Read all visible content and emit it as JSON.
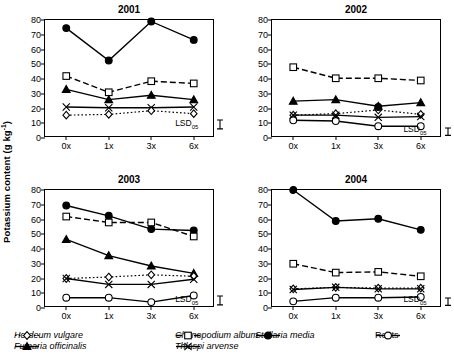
{
  "axis": {
    "ylabel_text": "Potassium content (g kg",
    "ylabel_sup": "-1",
    "ylabel_tail": ")",
    "yticks": [
      0,
      10,
      20,
      30,
      40,
      50,
      60,
      70,
      80
    ],
    "xticks": [
      "0x",
      "1x",
      "3x",
      "6x"
    ],
    "lsd_label": "LSD",
    "lsd_sub": "05"
  },
  "legend": [
    {
      "name": "Hordeum vulgare",
      "marker": "diamond-open",
      "line": "dotted",
      "italic": true,
      "row": 0,
      "col": 0
    },
    {
      "name": "Fumaria officinalis",
      "marker": "triangle-fill",
      "line": "solid",
      "italic": true,
      "row": 1,
      "col": 0
    },
    {
      "name": "Chenopodium album",
      "marker": "square-open",
      "line": "dashed",
      "italic": true,
      "row": 0,
      "col": 1
    },
    {
      "name": "Thlaspi arvense",
      "marker": "cross",
      "line": "solid",
      "italic": true,
      "row": 1,
      "col": 1
    },
    {
      "name": "Stellaria media",
      "marker": "circle-fill",
      "line": "solid",
      "italic": true,
      "row": 0,
      "col": 2
    },
    {
      "name": "Roots",
      "marker": "circle-open",
      "line": "solid",
      "italic": false,
      "row": 0,
      "col": 3
    }
  ],
  "chart_data": [
    {
      "type": "line",
      "title": "2001",
      "xlabel": "",
      "ylabel": "Potassium content (g kg-1)",
      "categories": [
        "0x",
        "1x",
        "3x",
        "6x"
      ],
      "ylim": [
        0,
        80
      ],
      "yticks": [
        0,
        10,
        20,
        30,
        40,
        50,
        60,
        70,
        80
      ],
      "grid": false,
      "lsd": {
        "label": "LSD05",
        "value": 6.0,
        "x": 3.55,
        "y": 9
      },
      "series": [
        {
          "name": "Stellaria media",
          "marker": "circle-fill",
          "line": "solid",
          "values": [
            74.5,
            52.5,
            79.0,
            66.5
          ]
        },
        {
          "name": "Chenopodium album",
          "marker": "square-open",
          "line": "dashed",
          "values": [
            42.0,
            31.0,
            38.5,
            37.0
          ]
        },
        {
          "name": "Fumaria officinalis",
          "marker": "triangle-fill",
          "line": "solid",
          "values": [
            33.0,
            26.0,
            29.0,
            26.0
          ]
        },
        {
          "name": "Thlaspi arvense",
          "marker": "cross",
          "line": "solid",
          "values": [
            21.0,
            20.5,
            20.5,
            21.0
          ]
        },
        {
          "name": "Hordeum vulgare",
          "marker": "diamond-open",
          "line": "dotted",
          "values": [
            15.5,
            16.0,
            18.5,
            16.5
          ]
        }
      ]
    },
    {
      "type": "line",
      "title": "2002",
      "xlabel": "",
      "ylabel": "Potassium content (g kg-1)",
      "categories": [
        "0x",
        "1x",
        "3x",
        "6x"
      ],
      "ylim": [
        0,
        80
      ],
      "yticks": [
        0,
        10,
        20,
        30,
        40,
        50,
        60,
        70,
        80
      ],
      "grid": false,
      "lsd": {
        "label": "LSD05",
        "value": 5.0,
        "x": 3.58,
        "y": 4.5
      },
      "series": [
        {
          "name": "Chenopodium album",
          "marker": "square-open",
          "line": "dashed",
          "values": [
            48.0,
            40.5,
            40.5,
            39.0
          ]
        },
        {
          "name": "Fumaria officinalis",
          "marker": "triangle-fill",
          "line": "solid",
          "values": [
            25.0,
            26.0,
            21.5,
            24.0
          ]
        },
        {
          "name": "Hordeum vulgare",
          "marker": "diamond-open",
          "line": "dotted",
          "values": [
            15.5,
            16.5,
            19.0,
            16.0
          ]
        },
        {
          "name": "Thlaspi arvense",
          "marker": "cross",
          "line": "solid",
          "values": [
            15.5,
            15.5,
            14.0,
            14.5
          ]
        },
        {
          "name": "Stellaria media",
          "marker": "circle-fill",
          "line": "solid",
          "values": [
            null,
            null,
            21.0,
            null
          ]
        },
        {
          "name": "Roots",
          "marker": "circle-open",
          "line": "solid",
          "values": [
            12.0,
            11.5,
            8.0,
            8.0
          ]
        }
      ]
    },
    {
      "type": "line",
      "title": "2003",
      "xlabel": "",
      "ylabel": "Potassium content (g kg-1)",
      "categories": [
        "0x",
        "1x",
        "3x",
        "6x"
      ],
      "ylim": [
        0,
        80
      ],
      "yticks": [
        0,
        10,
        20,
        30,
        40,
        50,
        60,
        70,
        80
      ],
      "grid": false,
      "lsd": {
        "label": "LSD05",
        "value": 6.0,
        "x": 3.55,
        "y": 5
      },
      "series": [
        {
          "name": "Stellaria media",
          "marker": "circle-fill",
          "line": "solid",
          "values": [
            69.5,
            62.5,
            53.5,
            52.5
          ]
        },
        {
          "name": "Chenopodium album",
          "marker": "square-open",
          "line": "dashed",
          "values": [
            62.0,
            58.0,
            58.0,
            48.5
          ]
        },
        {
          "name": "Fumaria officinalis",
          "marker": "triangle-fill",
          "line": "solid",
          "values": [
            46.5,
            35.5,
            28.5,
            23.5
          ]
        },
        {
          "name": "Hordeum vulgare",
          "marker": "diamond-open",
          "line": "dotted",
          "values": [
            20.0,
            21.0,
            22.5,
            21.5
          ]
        },
        {
          "name": "Thlaspi arvense",
          "marker": "cross",
          "line": "solid",
          "values": [
            20.0,
            16.0,
            16.0,
            19.5
          ]
        },
        {
          "name": "Roots",
          "marker": "circle-open",
          "line": "solid",
          "values": [
            7.0,
            7.0,
            4.0,
            8.5
          ]
        }
      ]
    },
    {
      "type": "line",
      "title": "2004",
      "xlabel": "",
      "ylabel": "Potassium content (g kg-1)",
      "categories": [
        "0x",
        "1x",
        "3x",
        "6x"
      ],
      "ylim": [
        0,
        80
      ],
      "yticks": [
        0,
        10,
        20,
        30,
        40,
        50,
        60,
        70,
        80
      ],
      "grid": false,
      "lsd": {
        "label": "LSD05",
        "value": 5.0,
        "x": 3.58,
        "y": 4.5
      },
      "series": [
        {
          "name": "Stellaria media",
          "marker": "circle-fill",
          "line": "solid",
          "values": [
            80.0,
            59.0,
            60.5,
            53.0
          ]
        },
        {
          "name": "Chenopodium album",
          "marker": "square-open",
          "line": "dashed",
          "values": [
            30.0,
            24.0,
            24.5,
            21.5
          ]
        },
        {
          "name": "Hordeum vulgare",
          "marker": "diamond-open",
          "line": "dotted",
          "values": [
            13.0,
            14.0,
            13.5,
            13.5
          ]
        },
        {
          "name": "Thlaspi arvense",
          "marker": "cross",
          "line": "solid",
          "values": [
            12.5,
            14.0,
            13.0,
            13.0
          ]
        },
        {
          "name": "Roots",
          "marker": "circle-open",
          "line": "solid",
          "values": [
            4.5,
            7.0,
            7.0,
            7.5
          ]
        }
      ]
    }
  ]
}
